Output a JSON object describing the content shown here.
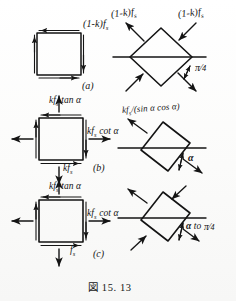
{
  "figure": {
    "caption": "図  15. 13",
    "caption_number": "15. 13"
  },
  "panels": [
    {
      "tag": "(a)",
      "left_element": {
        "shape": "square",
        "description": "square element in pure shear",
        "labels": [
          {
            "text": "(1-k)f",
            "sub": "s",
            "position": "top-right"
          }
        ]
      },
      "right_element": {
        "shape": "diamond",
        "rotation_deg": 45,
        "description": "square rotated 45 degrees with principal tension and compression arrows",
        "labels": [
          {
            "text": "(1-k)f",
            "sub": "s",
            "position": "upper-left"
          },
          {
            "text": "(1-k)f",
            "sub": "s",
            "position": "upper-right"
          }
        ],
        "angle_label": {
          "numerator": "π",
          "denominator": "4",
          "text": "π/4"
        }
      }
    },
    {
      "tag": "(b)",
      "left_element": {
        "shape": "square",
        "description": "square element with normal and shear stresses",
        "labels": [
          {
            "text": "kf",
            "sub": "s",
            "suffix": " tan α",
            "position": "top"
          },
          {
            "text": "kf",
            "sub": "s",
            "suffix": " cot α",
            "position": "right"
          },
          {
            "text": "kf",
            "sub": "s",
            "suffix": "",
            "position": "bottom"
          }
        ]
      },
      "right_element": {
        "shape": "rotated-square",
        "rotation_deg": -22,
        "description": "square rotated by angle alpha with diagonal compression arrows",
        "labels": [
          {
            "text": "kf",
            "sub": "s",
            "suffix": "/(sin α cos α)",
            "position": "upper-left"
          }
        ],
        "angle_label": {
          "text": "α"
        }
      }
    },
    {
      "tag": "(c)",
      "left_element": {
        "shape": "square",
        "description": "square element with combined stresses",
        "labels": [
          {
            "text": "kf",
            "sub": "s",
            "suffix": " tan α",
            "position": "top"
          },
          {
            "text": "kf",
            "sub": "s",
            "suffix": " cot α",
            "position": "right"
          },
          {
            "text": "f",
            "sub": "s",
            "suffix": "",
            "position": "bottom"
          }
        ]
      },
      "right_element": {
        "shape": "rotated-square",
        "rotation_deg": -22,
        "description": "square rotated showing range of principal directions",
        "labels": [],
        "angle_label": {
          "text": "α to π/4",
          "alpha": "α",
          "connector": "to",
          "numerator": "π",
          "denominator": "4"
        }
      }
    }
  ],
  "colors": {
    "ink": "#141414",
    "paper": "#fdfdfc"
  }
}
